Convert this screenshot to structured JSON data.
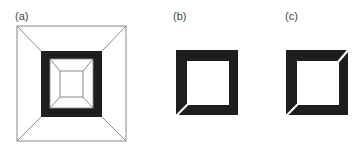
{
  "figure": {
    "panels": [
      {
        "label": "(a)",
        "description": "Square frame in perspective: outer square with diagonals to a thick black square band, inner square with diagonals to a small innermost square"
      },
      {
        "label": "(b)",
        "description": "Thick black square frame with a thin white diagonal cut at the bottom-left corner"
      },
      {
        "label": "(c)",
        "description": "Thick black square frame with thin white diagonal cuts at the bottom-left and top-right corners"
      }
    ],
    "colors": {
      "background": "#ffffff",
      "frame_fill": "#1e1e1e",
      "line": "#8a8a8a",
      "label": "#444444"
    }
  }
}
